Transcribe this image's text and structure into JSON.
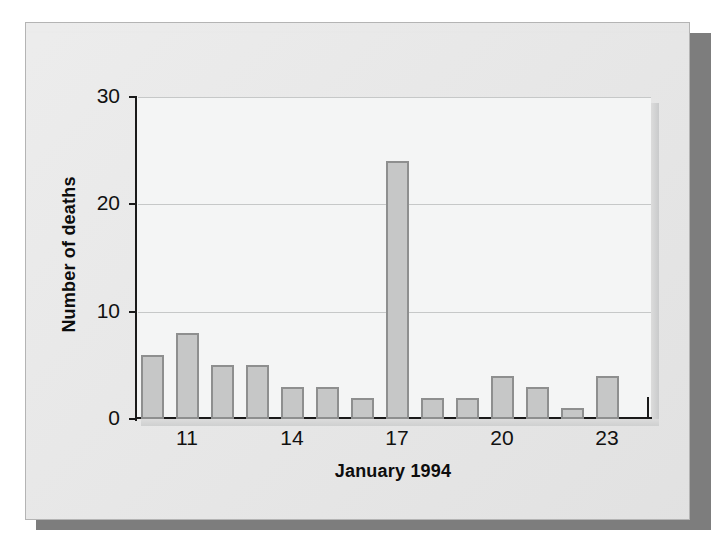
{
  "figure": {
    "frame_color": "#e6e6e6",
    "shadow_color": "#7d7d7d",
    "panel_color": "#f4f5f5"
  },
  "chart_data": {
    "type": "bar",
    "title": "",
    "subtitle": "",
    "xlabel": "January 1994",
    "ylabel": "Number of deaths",
    "categories": [
      10,
      11,
      12,
      13,
      14,
      15,
      16,
      17,
      18,
      19,
      20,
      21,
      22,
      23
    ],
    "values": [
      6,
      8,
      5,
      5,
      3,
      3,
      2,
      24,
      2,
      2,
      4,
      3,
      1,
      4
    ],
    "series": [
      {
        "name": "Number of deaths",
        "values": [
          6,
          8,
          5,
          5,
          3,
          3,
          2,
          24,
          2,
          2,
          4,
          3,
          1,
          4
        ]
      }
    ],
    "xlim": [
      9.5,
      24.0
    ],
    "ylim": [
      0,
      30
    ],
    "yticks": [
      0,
      10,
      20,
      30
    ],
    "ytick_labels": [
      "0",
      "10",
      "20",
      "30"
    ],
    "xticks": [
      11,
      14,
      17,
      20,
      23
    ],
    "xtick_labels": [
      "11",
      "14",
      "17",
      "20",
      "23"
    ],
    "grid": true,
    "grid_axis": "y",
    "legend": false,
    "legend_position": "none",
    "bar_fill_color": "#c6c7c7",
    "bar_edge_color": "#8e8f8f",
    "gridline_color": "#c6c8c8",
    "axis_color": "#1a1a1a",
    "annotations": []
  }
}
